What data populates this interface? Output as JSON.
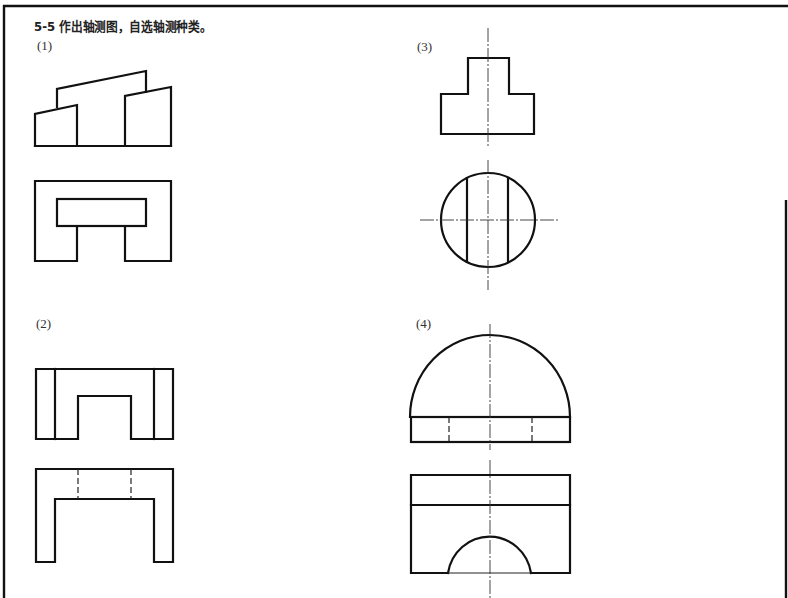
{
  "exercise": {
    "title": "5-5  作出轴测图，自选轴测种类。",
    "number": "5-5",
    "instruction": "作出轴测图，自选轴测种类。"
  },
  "problems": [
    {
      "label": "(1)",
      "views": [
        "front-view",
        "top-view"
      ],
      "description": "Stepped block with sloped tops; top view U-shaped frame with inner slot"
    },
    {
      "label": "(2)",
      "views": [
        "front-view",
        "top-view"
      ],
      "description": "Block with central rectangular notch; top view inverted U with hidden lines"
    },
    {
      "label": "(3)",
      "views": [
        "front-view",
        "top-view"
      ],
      "description": "T-shaped profile; top view circle with two parallel cut lines and centerlines"
    },
    {
      "label": "(4)",
      "views": [
        "front-view",
        "top-view"
      ],
      "description": "Hemispherical dome on rectangular base with hidden lines; top view rectangle with semicircular arch"
    }
  ],
  "colors": {
    "line": "#111111",
    "background": "#ffffff"
  }
}
